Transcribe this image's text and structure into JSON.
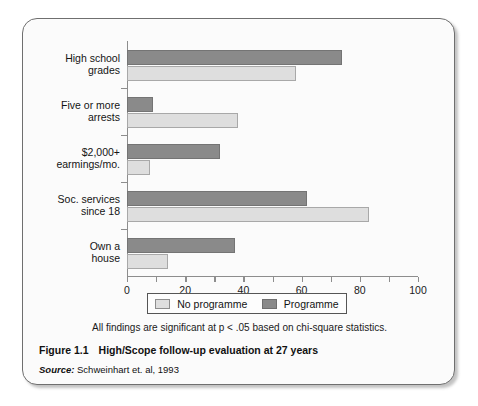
{
  "figure": {
    "number_label": "Figure 1.1",
    "title": "High/Scope follow-up evaluation at 27 years",
    "source_label": "Source:",
    "source_text": "Schweinhart et. al, 1993",
    "note": "All findings are significant at p < .05 based on chi-square statistics."
  },
  "legend": {
    "position": "below-axis",
    "entries": [
      {
        "label": "No programme",
        "color": "#dedede",
        "swatch": "legend-swatch-no-programme"
      },
      {
        "label": "Programme",
        "color": "#8a8a8a",
        "swatch": "legend-swatch-programme"
      }
    ]
  },
  "chart_data": {
    "type": "bar",
    "orientation": "horizontal",
    "title": "High/Scope follow-up evaluation at 27 years",
    "xlabel": "",
    "ylabel": "",
    "xlim": [
      0,
      100
    ],
    "xticks": [
      0,
      20,
      40,
      60,
      80,
      100
    ],
    "xtick_labels": [
      "0",
      "20",
      "40",
      "60",
      "80",
      "100"
    ],
    "minor_tick_interval": 10,
    "grid": false,
    "categories": [
      "High school grades",
      "Five or more arrests",
      "$2,000+ earmings/mo.",
      "Soc. services since 18",
      "Own a house"
    ],
    "category_lines": [
      [
        "High school",
        "grades"
      ],
      [
        "Five or more",
        "arrests"
      ],
      [
        "$2,000+",
        "earmings/mo."
      ],
      [
        "Soc. services",
        "since 18"
      ],
      [
        "Own a",
        "house"
      ]
    ],
    "series": [
      {
        "name": "Programme",
        "color": "#8a8a8a",
        "values": [
          74,
          9,
          32,
          62,
          37
        ]
      },
      {
        "name": "No programme",
        "color": "#dedede",
        "values": [
          58,
          38,
          8,
          83,
          14
        ]
      }
    ]
  }
}
